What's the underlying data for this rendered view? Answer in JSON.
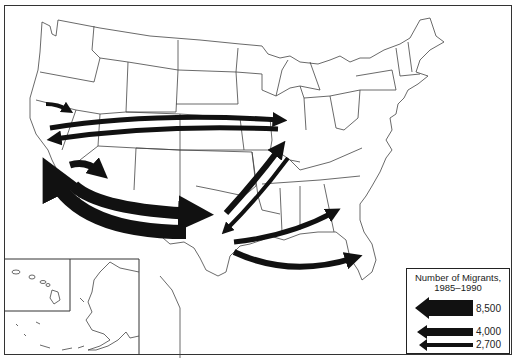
{
  "map": {
    "subject": "Interstate migration flows, contiguous United States",
    "insets": [
      "Hawaii",
      "Alaska"
    ]
  },
  "legend": {
    "title": "Number of Migrants,",
    "subtitle": "1985–1990",
    "items": [
      {
        "label": "8,500",
        "width": "thick"
      },
      {
        "label": "4,000",
        "width": "medium"
      },
      {
        "label": "2,700",
        "width": "thin"
      }
    ]
  },
  "flows": [
    {
      "from": "California",
      "to": "Nevada",
      "size": "thin"
    },
    {
      "from": "California",
      "to": "Illinois",
      "size": "medium"
    },
    {
      "from": "Illinois",
      "to": "California",
      "size": "medium"
    },
    {
      "from": "California",
      "to": "Arizona",
      "size": "medium"
    },
    {
      "from": "California",
      "to": "Texas",
      "size": "thick"
    },
    {
      "from": "Texas",
      "to": "California",
      "size": "thick"
    },
    {
      "from": "Texas",
      "to": "Illinois",
      "size": "medium"
    },
    {
      "from": "Illinois",
      "to": "Texas",
      "size": "thin"
    },
    {
      "from": "Texas",
      "to": "Georgia",
      "size": "medium"
    },
    {
      "from": "Texas",
      "to": "Florida",
      "size": "medium"
    }
  ],
  "colors": {
    "arrow": "#111111",
    "outline": "#444444",
    "background": "#ffffff"
  }
}
